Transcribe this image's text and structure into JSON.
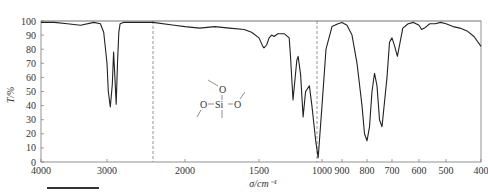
{
  "chart_data": {
    "type": "line",
    "title": "",
    "xlabel": "σ/cm⁻¹",
    "ylabel": "T/%",
    "ylim": [
      0,
      100
    ],
    "xlim": [
      4000,
      400
    ],
    "x_axis_reversed": true,
    "grid": false,
    "legend": null,
    "y_ticks": [
      0,
      10,
      20,
      30,
      40,
      50,
      60,
      70,
      80,
      90,
      100
    ],
    "x_tick_labels": [
      "4000",
      "3000",
      "2000",
      "1500",
      "1000",
      "900",
      "800",
      "700",
      "600",
      "500",
      "400"
    ],
    "scale_breaks": [
      2300,
      1000
    ],
    "annotations": [
      {
        "type": "structure",
        "label": "methoxy-silane fragment",
        "atoms": [
          "O",
          "O",
          "Si",
          "O"
        ]
      }
    ],
    "series": [
      {
        "name": "IR transmittance",
        "x": [
          4000,
          3800,
          3600,
          3400,
          3200,
          3100,
          3050,
          3000,
          2980,
          2950,
          2920,
          2900,
          2880,
          2860,
          2840,
          2820,
          2800,
          2750,
          2600,
          2400,
          2300,
          2100,
          2000,
          1900,
          1800,
          1700,
          1600,
          1550,
          1500,
          1470,
          1460,
          1440,
          1420,
          1400,
          1380,
          1350,
          1300,
          1260,
          1250,
          1230,
          1200,
          1190,
          1170,
          1150,
          1130,
          1100,
          1080,
          1050,
          1030,
          1000,
          980,
          950,
          920,
          900,
          880,
          860,
          840,
          820,
          810,
          800,
          790,
          780,
          770,
          760,
          750,
          740,
          720,
          710,
          700,
          690,
          680,
          660,
          640,
          620,
          600,
          590,
          580,
          560,
          540,
          520,
          500,
          480,
          460,
          440,
          420,
          400
        ],
        "values": [
          99,
          99,
          98,
          97,
          99,
          98,
          92,
          70,
          50,
          39,
          55,
          78,
          60,
          41,
          70,
          92,
          98,
          99,
          99,
          99,
          99,
          97,
          96,
          95,
          96,
          95,
          94,
          92,
          88,
          82,
          81,
          83,
          88,
          90,
          89,
          91,
          91,
          88,
          75,
          44,
          72,
          75,
          62,
          32,
          50,
          54,
          40,
          15,
          3,
          40,
          80,
          96,
          98,
          99,
          97,
          90,
          70,
          40,
          20,
          15,
          25,
          50,
          63,
          54,
          30,
          25,
          60,
          85,
          88,
          82,
          75,
          95,
          98,
          99,
          97,
          94,
          95,
          98,
          98,
          99,
          98,
          96,
          95,
          93,
          89,
          82
        ]
      }
    ]
  },
  "figure": {
    "y_axis_label": "T/%",
    "x_axis_label": "σ/cm⁻¹",
    "molecule": {
      "top_o": "O",
      "left_o": "O",
      "si": "Si",
      "right_o": "O"
    }
  }
}
